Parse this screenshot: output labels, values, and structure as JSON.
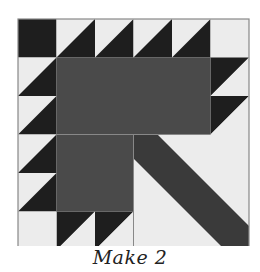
{
  "caption": "Make 2",
  "colors": {
    "dark": "#1e1e1e",
    "medium": "#4a4a4a",
    "light": "#ececec",
    "outline": "#888888",
    "stem": "#3a3a3a"
  },
  "block": {
    "name": "Basket / Tree quilt block",
    "grid": 6,
    "left": 18,
    "top": 19,
    "cell": 38.5
  }
}
